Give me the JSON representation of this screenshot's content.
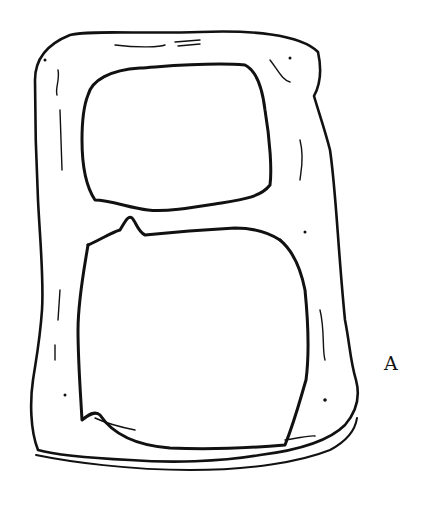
{
  "figure": {
    "label": "A",
    "ink_color": "#111111",
    "background": "#ffffff"
  }
}
